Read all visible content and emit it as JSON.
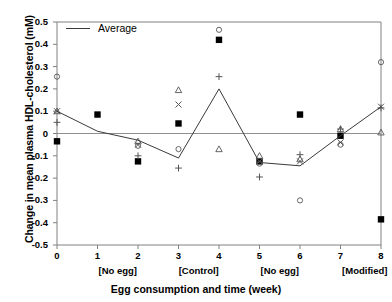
{
  "chart_data": {
    "type": "scatter",
    "title": "",
    "xlabel": "Egg consumption and time (week)",
    "ylabel": "Change in mean plasma HDL-cholesterol (mM)",
    "xlim": [
      0,
      8
    ],
    "ylim": [
      -0.5,
      0.5
    ],
    "grid": false,
    "legend_position": "top-left",
    "x_ticks": [
      "0",
      "1",
      "2",
      "3",
      "4",
      "5",
      "6",
      "7",
      "8"
    ],
    "x_tick_values": [
      0,
      1,
      2,
      3,
      4,
      5,
      6,
      7,
      8
    ],
    "y_ticks": [
      "0.5",
      "0.4",
      "0.3",
      "0.2",
      "0.1",
      "0",
      "-0.1",
      "-0.2",
      "-0.3",
      "-0.4",
      "-0.5"
    ],
    "y_tick_values": [
      0.5,
      0.4,
      0.3,
      0.2,
      0.1,
      0,
      -0.1,
      -0.2,
      -0.3,
      -0.4,
      -0.5
    ],
    "phase_labels": [
      {
        "text": "[No egg]",
        "x": 1.5
      },
      {
        "text": "[Control]",
        "x": 3.5
      },
      {
        "text": "[No egg]",
        "x": 5.5
      },
      {
        "text": "[Modified]",
        "x": 7.6
      }
    ],
    "legend": [
      {
        "label": "Average",
        "marker": "line",
        "color": "#3a3a3a"
      }
    ],
    "x": [
      0,
      1,
      2,
      3,
      4,
      5,
      6,
      7,
      8
    ],
    "series": [
      {
        "name": "Average",
        "marker": "line",
        "color": "#3a3a3a",
        "values": [
          0.1,
          0.01,
          -0.03,
          -0.11,
          0.2,
          -0.13,
          -0.145,
          -0.01,
          0.12
        ]
      },
      {
        "name": "Subject filled-square",
        "marker": "filled-square",
        "color": "#000000",
        "values": [
          -0.035,
          0.085,
          -0.125,
          0.045,
          0.42,
          -0.125,
          0.085,
          -0.01,
          -0.385
        ]
      },
      {
        "name": "Subject open-circle",
        "marker": "open-circle",
        "color": "#555555",
        "values": [
          0.255,
          null,
          -0.055,
          -0.07,
          0.465,
          -0.135,
          -0.3,
          -0.05,
          0.32
        ]
      },
      {
        "name": "Subject open-triangle",
        "marker": "open-triangle",
        "color": "#555555",
        "values": [
          0.1,
          null,
          -0.035,
          0.195,
          -0.07,
          -0.1,
          -0.115,
          0.02,
          0.005
        ]
      },
      {
        "name": "Subject cross-x",
        "marker": "cross-x",
        "color": "#555555",
        "values": [
          0.1,
          null,
          -0.05,
          0.13,
          null,
          -0.125,
          -0.125,
          -0.04,
          0.12
        ]
      },
      {
        "name": "Subject plus",
        "marker": "plus",
        "color": "#555555",
        "values": [
          0.05,
          null,
          -0.1,
          -0.155,
          0.255,
          -0.195,
          -0.095,
          0.02,
          0.115
        ]
      }
    ]
  }
}
